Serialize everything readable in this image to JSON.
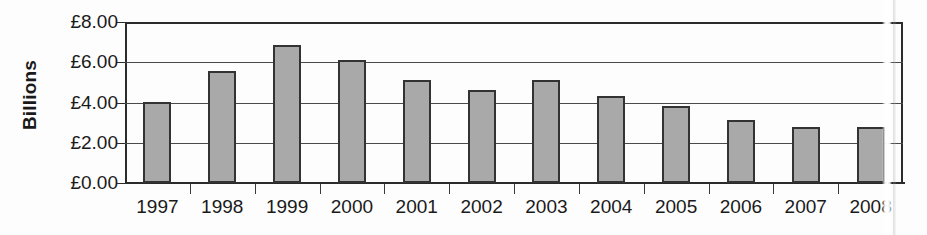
{
  "chart_data": {
    "type": "bar",
    "title": "",
    "xlabel": "",
    "ylabel": "Billions",
    "categories": [
      "1997",
      "1998",
      "1999",
      "2000",
      "2001",
      "2002",
      "2003",
      "2004",
      "2005",
      "2006",
      "2007",
      "2008"
    ],
    "values": [
      4.05,
      5.55,
      6.85,
      6.1,
      5.1,
      4.6,
      5.1,
      4.3,
      3.85,
      3.15,
      2.8,
      2.8
    ],
    "ylim": [
      0,
      8
    ],
    "ytick_values": [
      0,
      2,
      4,
      6,
      8
    ],
    "ytick_labels": [
      "£0.00",
      "£2.00",
      "£4.00",
      "£6.00",
      "£8.00"
    ],
    "currency_symbol": "£",
    "grid": true,
    "legend": false,
    "bar_color": "#a9a9a9",
    "bar_border_color": "#333333",
    "axis_color": "#2b2b2b",
    "gridline_color": "#4a4a4a",
    "background_color": "#fdfdfd",
    "annotations": [
      {
        "name": "scan-crease-artifact",
        "description": "Vertical white fold line from the scanned page crossing the right edge of the plot and splitting the 2008 label"
      }
    ]
  }
}
